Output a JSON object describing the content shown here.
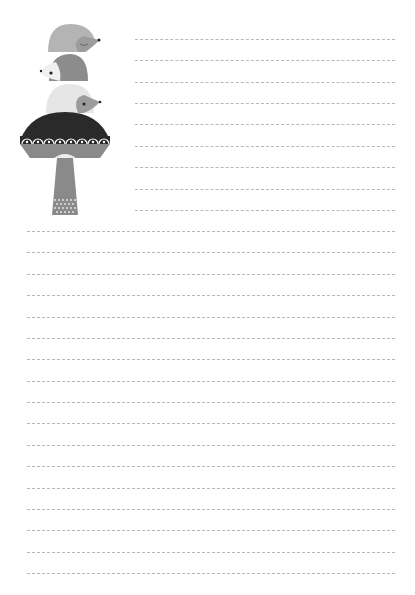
{
  "page": {
    "type": "lined-notepaper",
    "background": "#ffffff"
  },
  "illustration": {
    "subject": "three-hedgehogs-stacked-on-mushroom",
    "colors": {
      "hedgehog_top": "#b4b4b4",
      "hedgehog_middle": "#8c8c8c",
      "hedgehog_bottom": "#e6e6e6",
      "mushroom_cap": "#2a2a2a",
      "mushroom_band": "#8a8a8a",
      "mushroom_stem": "#8a8a8a"
    }
  },
  "lines": {
    "color": "#b8b8b8",
    "style": "dashed",
    "short": {
      "x_start": 135,
      "x_end": 395,
      "y": [
        39,
        60,
        82,
        103,
        124,
        146,
        167,
        189,
        210
      ]
    },
    "full": {
      "x_start": 27,
      "x_end": 395,
      "y": [
        231,
        252,
        274,
        295,
        317,
        338,
        359,
        381,
        402,
        423,
        445,
        466,
        488,
        509,
        530,
        552,
        573
      ]
    }
  }
}
